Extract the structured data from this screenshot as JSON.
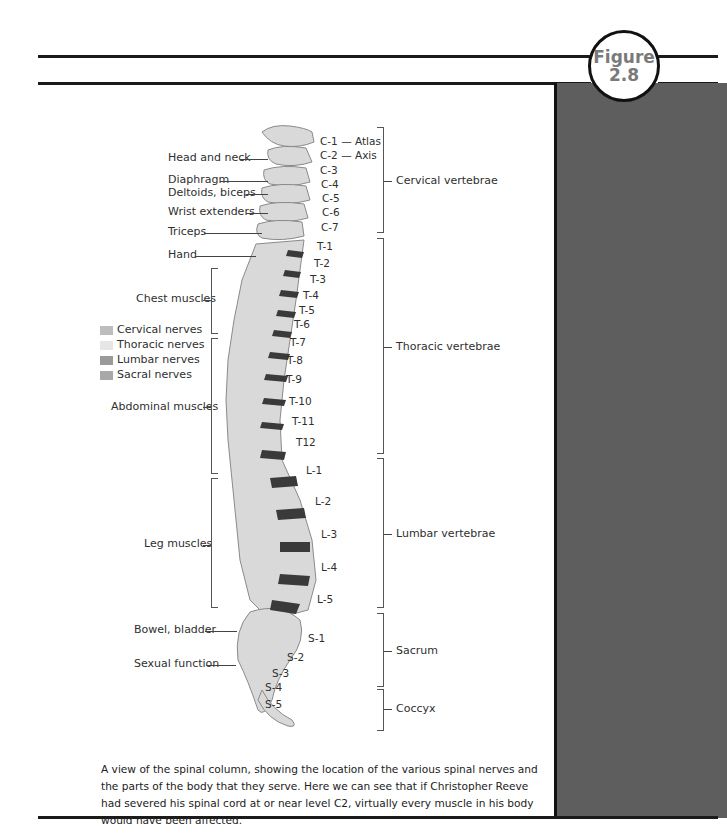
{
  "figure": {
    "badge_line1": "Figure",
    "badge_line2": "2.8"
  },
  "colors": {
    "sidebar": "#5e5e5e",
    "rules": "#1a1a1a",
    "bone": "#d9d9d9",
    "disc": "#3a3a3a"
  },
  "legend": [
    {
      "label": "Cervical nerves",
      "color": "#bdbdbd"
    },
    {
      "label": "Thoracic nerves",
      "color": "#e6e6e6"
    },
    {
      "label": "Lumbar nerves",
      "color": "#9a9a9a"
    },
    {
      "label": "Sacral nerves",
      "color": "#a8a8a8"
    }
  ],
  "body_parts": [
    {
      "label": "Head and neck"
    },
    {
      "label": "Diaphragm"
    },
    {
      "label": "Deltoids, biceps"
    },
    {
      "label": "Wrist extenders"
    },
    {
      "label": "Triceps"
    },
    {
      "label": "Hand"
    },
    {
      "label": "Chest muscles"
    },
    {
      "label": "Abdominal muscles"
    },
    {
      "label": "Leg muscles"
    },
    {
      "label": "Bowel, bladder"
    },
    {
      "label": "Sexual function"
    }
  ],
  "vertebrae": {
    "cervical": [
      "C-1 — Atlas",
      "C-2 — Axis",
      "C-3",
      "C-4",
      "C-5",
      "C-6",
      "C-7"
    ],
    "thoracic": [
      "T-1",
      "T-2",
      "T-3",
      "T-4",
      "T-5",
      "T-6",
      "T-7",
      "T-8",
      "T-9",
      "T-10",
      "T-11",
      "T12"
    ],
    "lumbar": [
      "L-1",
      "L-2",
      "L-3",
      "L-4",
      "L-5"
    ],
    "sacral": [
      "S-1",
      "S-2",
      "S-3",
      "S-4",
      "S-5"
    ]
  },
  "regions": [
    {
      "label": "Cervical vertebrae"
    },
    {
      "label": "Thoracic vertebrae"
    },
    {
      "label": "Lumbar vertebrae"
    },
    {
      "label": "Sacrum"
    },
    {
      "label": "Coccyx"
    }
  ],
  "caption": "A view of the spinal column, showing the location of the various spinal nerves and the parts of the body that they serve. Here we can see that if Christopher Reeve had severed his spinal cord at or near level C2, virtually every muscle in his body would have been affected."
}
